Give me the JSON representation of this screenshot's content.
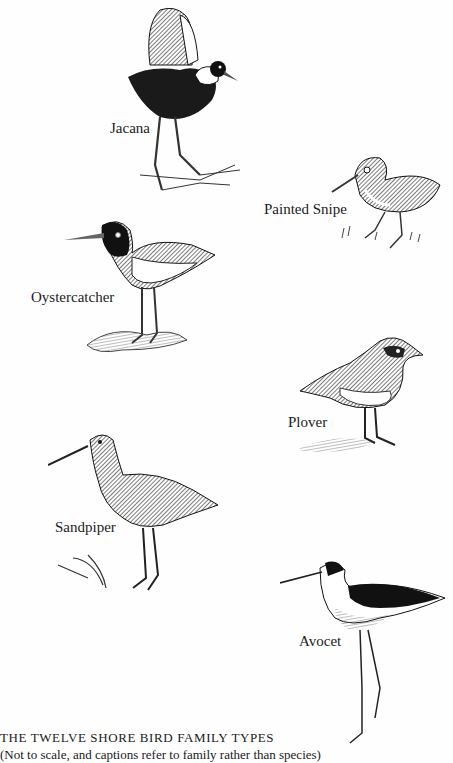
{
  "page": {
    "birds": [
      {
        "name": "Jacana"
      },
      {
        "name": "Painted Snipe"
      },
      {
        "name": "Oystercatcher"
      },
      {
        "name": "Plover"
      },
      {
        "name": "Sandpiper"
      },
      {
        "name": "Avocet"
      }
    ],
    "caption": {
      "title": "THE TWELVE SHORE BIRD FAMILY TYPES",
      "subtitle": "(Not to scale, and captions refer to family rather than species)"
    }
  }
}
